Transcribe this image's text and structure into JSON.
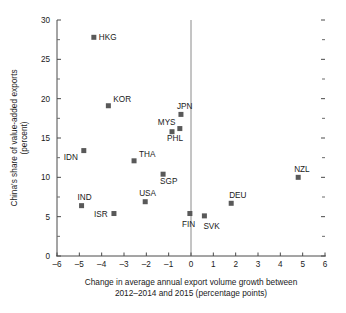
{
  "chart_data": {
    "type": "scatter",
    "title": "",
    "xlabel": "Change in average annual export volume growth between 2012–2014 and 2015 (percentage points)",
    "xlabel_line1": "Change in average annual export volume growth between",
    "xlabel_line2": "2012–2014 and 2015 (percentage points)",
    "ylabel": "China's share of value-added exports (percent)",
    "ylabel_line1": "China's share of value-added exports",
    "ylabel_line2": "(percent)",
    "xlim": [
      -6,
      6
    ],
    "ylim": [
      0,
      30
    ],
    "xticks": [
      -6,
      -5,
      -4,
      -3,
      -2,
      -1,
      0,
      1,
      2,
      3,
      4,
      5,
      6
    ],
    "xticklabels": [
      "–6",
      "–5",
      "–4",
      "–3",
      "–2",
      "–1",
      "0",
      "1",
      "2",
      "3",
      "4",
      "5",
      "6"
    ],
    "yticks": [
      0,
      5,
      10,
      15,
      20,
      25,
      30
    ],
    "yticklabels": [
      "0",
      "5",
      "10",
      "15",
      "20",
      "25",
      "30"
    ],
    "yminorticks": [
      2.5,
      7.5,
      12.5,
      17.5,
      22.5,
      27.5
    ],
    "grid": false,
    "legend": false,
    "marker_color": "#595959",
    "zero_line": 0,
    "points": [
      {
        "label": "HKG",
        "x": -4.35,
        "y": 27.8,
        "label_dx": 5,
        "label_dy": 3.0
      },
      {
        "label": "KOR",
        "x": -3.7,
        "y": 19.1,
        "label_dx": 5,
        "label_dy": -3.5
      },
      {
        "label": "JPN",
        "x": -0.45,
        "y": 18.0,
        "label_dx": -4,
        "label_dy": -5.5
      },
      {
        "label": "MYS",
        "x": -0.5,
        "y": 16.2,
        "label_dx": -22,
        "label_dy": -3.5
      },
      {
        "label": "PHL",
        "x": -0.85,
        "y": 15.8,
        "label_dx": -5,
        "label_dy": 9.0
      },
      {
        "label": "IDN",
        "x": -4.8,
        "y": 13.4,
        "label_dx": -20,
        "label_dy": 9.0
      },
      {
        "label": "THA",
        "x": -2.55,
        "y": 12.1,
        "label_dx": 5,
        "label_dy": -3.5
      },
      {
        "label": "SGP",
        "x": -1.25,
        "y": 10.4,
        "label_dx": -3,
        "label_dy": 10.0
      },
      {
        "label": "NZL",
        "x": 4.8,
        "y": 10.0,
        "label_dx": -4,
        "label_dy": -5.5
      },
      {
        "label": "DEU",
        "x": 1.8,
        "y": 6.7,
        "label_dx": -2,
        "label_dy": -5.5
      },
      {
        "label": "USA",
        "x": -2.05,
        "y": 6.9,
        "label_dx": -6,
        "label_dy": -5.5
      },
      {
        "label": "IND",
        "x": -4.9,
        "y": 6.4,
        "label_dx": -4,
        "label_dy": -5.5
      },
      {
        "label": "ISR",
        "x": -3.45,
        "y": 5.4,
        "label_dx": -20,
        "label_dy": 3.0
      },
      {
        "label": "FIN",
        "x": -0.05,
        "y": 5.4,
        "label_dx": -8,
        "label_dy": 13.0
      },
      {
        "label": "SVK",
        "x": 0.6,
        "y": 5.1,
        "label_dx": -1,
        "label_dy": 13.0
      }
    ]
  }
}
